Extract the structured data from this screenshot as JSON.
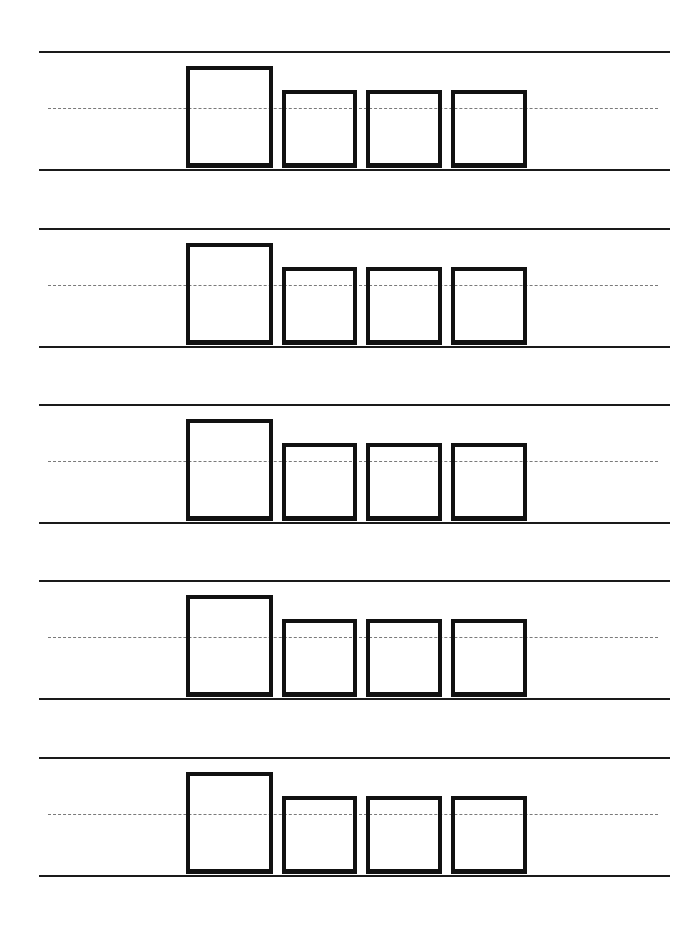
{
  "worksheet": {
    "type": "handwriting-letter-boxes",
    "rows": [
      {
        "index": 1,
        "top": 51,
        "boxes": [
          "tall",
          "short",
          "short",
          "short"
        ]
      },
      {
        "index": 2,
        "top": 228,
        "boxes": [
          "tall",
          "short",
          "short",
          "short"
        ]
      },
      {
        "index": 3,
        "top": 404,
        "boxes": [
          "tall",
          "short",
          "short",
          "short"
        ]
      },
      {
        "index": 4,
        "top": 580,
        "boxes": [
          "tall",
          "short",
          "short",
          "short"
        ]
      },
      {
        "index": 5,
        "top": 757,
        "boxes": [
          "tall",
          "short",
          "short",
          "short"
        ]
      }
    ],
    "colors": {
      "line": "#1a1a1a",
      "dashed_midline": "#7a7a7a",
      "box_border": "#111111",
      "background": "#ffffff"
    }
  }
}
